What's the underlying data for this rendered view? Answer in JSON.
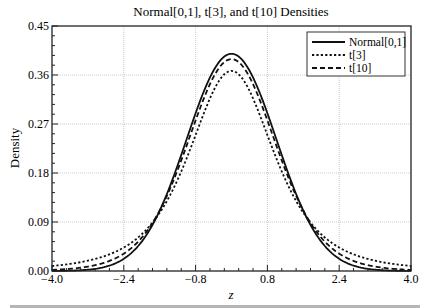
{
  "chart_data": {
    "type": "line",
    "title": "Normal[0,1], t[3], and t[10] Densities",
    "xlabel": "z",
    "ylabel": "Density",
    "xlim": [
      -4.0,
      4.0
    ],
    "ylim": [
      0.0,
      0.45
    ],
    "xticks": [
      -4.0,
      -2.4,
      -0.8,
      0.8,
      2.4,
      4.0
    ],
    "xtick_labels": [
      "−4.0",
      "−2.4",
      "−0.8",
      "0.8",
      "2.4",
      "4.0"
    ],
    "yticks": [
      0.0,
      0.09,
      0.18,
      0.27,
      0.36,
      0.45
    ],
    "ytick_labels": [
      "0.00",
      "0.09",
      "0.18",
      "0.27",
      "0.36",
      "0.45"
    ],
    "grid": true,
    "legend_position": "upper right",
    "x": [
      -4.0,
      -3.2,
      -2.4,
      -1.6,
      -0.8,
      0.0,
      0.8,
      1.6,
      2.4,
      3.2,
      4.0
    ],
    "series": [
      {
        "name": "Normal[0,1]",
        "style": "solid",
        "df": null,
        "values": [
          0.0001,
          0.0024,
          0.0224,
          0.1109,
          0.2897,
          0.3989,
          0.2897,
          0.1109,
          0.0224,
          0.0024,
          0.0001
        ]
      },
      {
        "name": "t[3]",
        "style": "dotted",
        "df": 3,
        "values": [
          0.0092,
          0.0178,
          0.0389,
          0.1037,
          0.2554,
          0.3676,
          0.2554,
          0.1037,
          0.0389,
          0.0178,
          0.0092
        ]
      },
      {
        "name": "t[10]",
        "style": "dashed",
        "df": 10,
        "values": [
          0.0028,
          0.0068,
          0.0265,
          0.1094,
          0.2794,
          0.3891,
          0.2794,
          0.1094,
          0.0265,
          0.0068,
          0.0028
        ]
      }
    ]
  },
  "legend": {
    "items": [
      "Normal[0,1]",
      "t[3]",
      "t[10]"
    ]
  },
  "colors": {
    "line": "#111111",
    "grid": "#bdbdbd",
    "axis": "#222222",
    "bottom_bar": "#b5b5b5"
  }
}
